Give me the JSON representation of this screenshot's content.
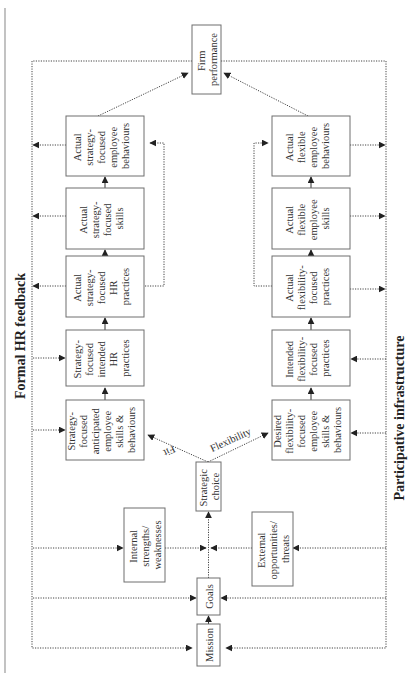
{
  "diagram": {
    "orientation": "rotated-90-ccw",
    "side_labels": {
      "left": "Formal HR feedback",
      "right": "Participative infrastructure"
    },
    "nodes": {
      "firm_performance": [
        "Firm",
        "performance"
      ],
      "strategy_behaviours": [
        "Actual",
        "strategy-",
        "focused",
        "employee",
        "behaviours"
      ],
      "strategy_skills": [
        "Actual",
        "strategy-",
        "focused",
        "skills"
      ],
      "strategy_actual_hr": [
        "Actual",
        "strategy-",
        "focused",
        "HR",
        "practices"
      ],
      "strategy_intended_hr": [
        "Strategy-",
        "focused",
        "intended",
        "HR",
        "practices"
      ],
      "strategy_anticipated": [
        "Strategy-",
        "focused",
        "anticipated",
        "employee",
        "skills &",
        "behaviours"
      ],
      "flex_behaviours": [
        "Actual",
        "flexible",
        "employee",
        "behaviours"
      ],
      "flex_skills": [
        "Actual",
        "flexible",
        "employee",
        "skills"
      ],
      "flex_actual_practices": [
        "Actual",
        "flexibility-",
        "focused",
        "practices"
      ],
      "flex_intended_practices": [
        "Intended",
        "flexibility-",
        "focused",
        "practices"
      ],
      "flex_desired": [
        "Desired",
        "flexibility-",
        "focused",
        "employee",
        "skills &",
        "behaviours"
      ],
      "strategic_choice": [
        "Strategic",
        "choice"
      ],
      "internal": [
        "Internal",
        "strengths/",
        "weaknesses"
      ],
      "external": [
        "External",
        "opportunities/",
        "threats"
      ],
      "goals": [
        "Goals"
      ],
      "mission": [
        "Mission"
      ]
    },
    "edge_labels": {
      "fit": "Fit",
      "flexibility": "Flexibility"
    },
    "colors": {
      "box_border": "#6e6e6e",
      "line": "#444444",
      "text": "#333333"
    }
  }
}
